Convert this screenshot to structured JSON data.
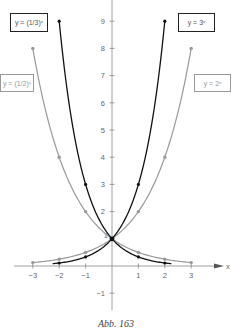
{
  "chart_data": {
    "type": "line",
    "title": "",
    "caption": "Abb. 163",
    "xlabel": "x",
    "ylabel": "",
    "xlim": [
      -3.2,
      3.6
    ],
    "ylim": [
      -1.5,
      9.5
    ],
    "x_ticks": [
      "−3",
      "−2",
      "−1",
      "1",
      "2",
      "3"
    ],
    "y_ticks": [
      "−1",
      "1",
      "2",
      "3",
      "4",
      "5",
      "6",
      "7",
      "8",
      "9"
    ],
    "grid": false,
    "series": [
      {
        "name": "y = (1/3)^x",
        "label_display": "y = (1/3)ˣ",
        "color": "#111111",
        "x": [
          -2,
          -1,
          0,
          1,
          2
        ],
        "y": [
          9,
          3,
          1,
          0.333,
          0.111
        ]
      },
      {
        "name": "y = 3^x",
        "label_display": "y = 3ˣ",
        "color": "#111111",
        "x": [
          -2,
          -1,
          0,
          1,
          2
        ],
        "y": [
          0.111,
          0.333,
          1,
          3,
          9
        ]
      },
      {
        "name": "y = (1/2)^x",
        "label_display": "y = (1/2)ˣ",
        "color": "#999999",
        "x": [
          -3,
          -2,
          -1,
          0,
          1,
          2,
          3
        ],
        "y": [
          8,
          4,
          2,
          1,
          0.5,
          0.25,
          0.125
        ]
      },
      {
        "name": "y = 2^x",
        "label_display": "y = 2ˣ",
        "color": "#999999",
        "x": [
          -3,
          -2,
          -1,
          0,
          1,
          2,
          3
        ],
        "y": [
          0.125,
          0.25,
          0.5,
          1,
          2,
          4,
          8
        ]
      }
    ]
  },
  "labels": {
    "third": "y = (1/3)ˣ",
    "three": "y = 3ˣ",
    "half": "y = (1/2)ˣ",
    "two": "y = 2ˣ"
  },
  "caption": "Abb. 163"
}
